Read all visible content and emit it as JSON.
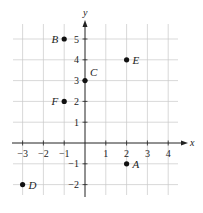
{
  "chart_data": {
    "type": "scatter",
    "title": "",
    "xlabel": "x",
    "ylabel": "y",
    "xlim": [
      -3.3,
      4.6
    ],
    "ylim": [
      -2.4,
      5.8
    ],
    "grid": true,
    "x_ticks": [
      -3,
      -2,
      -1,
      1,
      2,
      3,
      4
    ],
    "y_ticks": [
      -2,
      -1,
      1,
      2,
      3,
      4,
      5
    ],
    "points": [
      {
        "label": "A",
        "x": 2,
        "y": -1,
        "label_side": "right"
      },
      {
        "label": "B",
        "x": -1,
        "y": 5,
        "label_side": "left"
      },
      {
        "label": "C",
        "x": 0,
        "y": 3,
        "label_side": "upper-right"
      },
      {
        "label": "D",
        "x": -3,
        "y": -2,
        "label_side": "right"
      },
      {
        "label": "E",
        "x": 2,
        "y": 4,
        "label_side": "right"
      },
      {
        "label": "F",
        "x": -1,
        "y": 2,
        "label_side": "left"
      }
    ]
  },
  "colors": {
    "axis": "#222222",
    "grid": "#c8c8c8",
    "point": "#111111",
    "text": "#222222"
  }
}
